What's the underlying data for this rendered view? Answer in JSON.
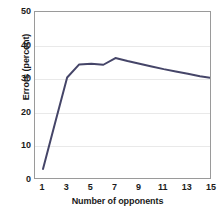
{
  "chart_data": {
    "type": "line",
    "title": "",
    "subtitle": "",
    "xlabel": "Number of opponents",
    "ylabel": "Errors (percent)",
    "xlim": [
      1,
      15
    ],
    "ylim": [
      0,
      50
    ],
    "grid": true,
    "legend": null,
    "legend_position": "none",
    "line_color": "#454568",
    "line_width": 2,
    "y_ticks": [
      50,
      40,
      30,
      20,
      10,
      0
    ],
    "y_tick_labels": [
      "50",
      "40",
      "30",
      "20",
      "10",
      "0"
    ],
    "x_ticks": [
      1,
      3,
      5,
      7,
      9,
      11,
      13,
      15
    ],
    "x_tick_labels": [
      "1",
      "3",
      "5",
      "7",
      "9",
      "11",
      "13",
      "15"
    ],
    "x": [
      1,
      2,
      3,
      4,
      5,
      6,
      7,
      8,
      9,
      10,
      11,
      12,
      13,
      14,
      15
    ],
    "values": [
      3.3,
      17.0,
      30.5,
      34.4,
      34.6,
      34.3,
      36.3,
      35.4,
      34.6,
      33.8,
      33.0,
      32.3,
      31.6,
      30.9,
      30.3
    ],
    "series": [
      {
        "name": "Errors",
        "values": [
          3.3,
          17.0,
          30.5,
          34.4,
          34.6,
          34.3,
          36.3,
          35.4,
          34.6,
          33.8,
          33.0,
          32.3,
          31.6,
          30.9,
          30.3
        ]
      }
    ],
    "annotations": []
  }
}
